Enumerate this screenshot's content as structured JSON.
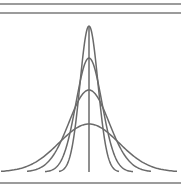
{
  "diagram": {
    "title": "",
    "colors": {
      "line": "#6a6a6a",
      "rule": "#7a7a7a",
      "background": "#ffffff"
    },
    "frame": {
      "rules_y": [
        4,
        13,
        183
      ],
      "x_start": 0,
      "x_end": 181
    },
    "center_x": 89,
    "baseline_y": 172,
    "center_line": {
      "top_y": 26,
      "bottom_y": 172
    },
    "curves": [
      {
        "name": "curve-1",
        "peak_y": 26,
        "sigma": 6
      },
      {
        "name": "curve-2",
        "peak_y": 58,
        "sigma": 11
      },
      {
        "name": "curve-3",
        "peak_y": 90,
        "sigma": 17
      },
      {
        "name": "curve-4",
        "peak_y": 124,
        "sigma": 28
      },
      {
        "name": "curve-5",
        "peak_y": 172,
        "sigma": 0
      }
    ],
    "extra_curves": [
      {
        "name": "curve-wide-1",
        "peak_y": 108,
        "sigma": 19,
        "x_left": 28,
        "x_right": 152
      },
      {
        "name": "curve-wide-2",
        "peak_y": 124,
        "sigma": 32,
        "x_left": 2,
        "x_right": 181
      }
    ]
  }
}
